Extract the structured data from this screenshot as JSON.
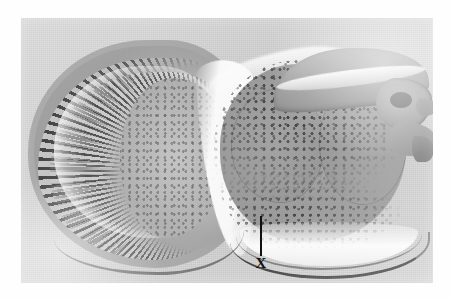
{
  "figure": {
    "domain_label": "histological-micrograph",
    "caption_text": "",
    "page_background_color": "#ffffff"
  },
  "micrograph": {
    "title": "",
    "modality": "light microscopy, stained sagittal section",
    "subject": "arthropod head section",
    "orientation": "compound eye at left, brain and cephalic tissue at right",
    "plate": {
      "left_px": 21,
      "top_px": 18,
      "width_px": 412,
      "height_px": 265,
      "background_color": "#d2d2d2",
      "tone": "grayscale"
    },
    "regions": [
      {
        "name": "compound-eye",
        "description": "large hemispherical compound eye occupying the left half, with radially arranged ommatidia",
        "tone_color": "#a9a9a9"
      },
      {
        "name": "ommatidia-array",
        "description": "dense radial spokes of alternating dark pigment cells and pale crystalline cones",
        "tone_color": "#191919"
      },
      {
        "name": "pigment-band",
        "description": "darkest peripheral band of screening pigment at the corneal margin",
        "tone_color": "#0a0a0a"
      },
      {
        "name": "crystalline-cone-band",
        "description": "inner secondary band of cones beneath the retinula layer",
        "tone_color": "#282828"
      },
      {
        "name": "fenestrated-membrane",
        "description": "bright arc marking the basement membrane behind the retina",
        "tone_color": "#f0f0f0"
      },
      {
        "name": "lamina-medulla",
        "description": "speckled optic neuropil immediately proximal to the eye",
        "tone_color": "#b0b0b0"
      },
      {
        "name": "optic-chiasma-channel",
        "description": "bright S-shaped haemocoel cleft separating optic lobe from central brain",
        "tone_color": "#fcfcfc"
      },
      {
        "name": "brain-mass",
        "description": "large mid-gray central nervous mass with two principal lobes",
        "tone_color": "#9c9c9c"
      },
      {
        "name": "cortical-cell-layer",
        "description": "granular dark-stained perikaryal rind capping the brain dorsally and ventrally",
        "tone_color": "#232323"
      },
      {
        "name": "dorsal-cuticle",
        "description": "overlying cuticle and epidermis arching across the top right",
        "tone_color": "#9e9e9e"
      },
      {
        "name": "rostral-projection",
        "description": "anterior projecting lobe with notch at the far right margin",
        "tone_color": "#989898"
      },
      {
        "name": "ventral-cuticle",
        "description": "dark cuticular rim bounding the section ventrally with a pale subcuticular space",
        "tone_color": "#1c1c1c"
      }
    ]
  },
  "annotation": {
    "label": "X",
    "label_color": "#111111",
    "pointer": {
      "type": "leader-line",
      "orientation": "vertical",
      "color": "#111111",
      "x_px": 261,
      "y_start_px": 216,
      "y_end_px": 256,
      "points_to": "small rounded structure at the ventral border between the optic region and the brain mass"
    },
    "label_position": {
      "x_px": 261,
      "y_px": 264
    }
  }
}
